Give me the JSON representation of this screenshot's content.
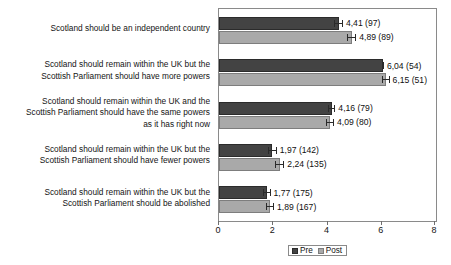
{
  "chart_data": {
    "type": "bar",
    "orientation": "horizontal",
    "title": "",
    "xlabel": "",
    "ylabel": "",
    "xlim": [
      0,
      8
    ],
    "xticks": [
      0,
      2,
      4,
      6,
      8
    ],
    "xtick_labels": [
      "0",
      "2",
      "4",
      "6",
      "8"
    ],
    "grid": false,
    "legend_position": "bottom",
    "decimal_separator": ",",
    "value_label_format": "mean (n)",
    "categories": [
      "Scotland should be an independent country",
      "Scotland should remain within the UK but the Scottish Parliament should have more powers",
      "Scotland should remain within the UK and the Scottish Parliament should have the same powers as it has right now",
      "Scotland should remain within the UK but the Scottish Parliament should have fewer powers",
      "Scotland should remain within the UK but the Scottish Parliament should be abolished"
    ],
    "category_lines": [
      [
        "Scotland should be an independent country"
      ],
      [
        "Scotland should remain within the UK but the",
        "Scottish Parliament should have more powers"
      ],
      [
        "Scotland should remain within the UK and the",
        "Scottish Parliament should have the same powers",
        "as it has right now"
      ],
      [
        "Scotland should remain within the UK but the",
        "Scottish Parliament should have fewer powers"
      ],
      [
        "Scotland should remain within the UK but the",
        "Scottish Parliament should be abolished"
      ]
    ],
    "series": [
      {
        "name": "Pre",
        "color": "#434343",
        "values": [
          4.41,
          6.04,
          4.16,
          1.97,
          1.77
        ],
        "counts": [
          97,
          54,
          79,
          142,
          175
        ],
        "labels": [
          "4,41 (97)",
          "6,04 (54)",
          "4,16 (79)",
          "1,97 (142)",
          "1,77 (175)"
        ]
      },
      {
        "name": "Post",
        "color": "#a9a9a9",
        "values": [
          4.89,
          6.15,
          4.09,
          2.24,
          1.89
        ],
        "counts": [
          89,
          51,
          80,
          135,
          167
        ],
        "labels": [
          "4,89 (89)",
          "6,15 (51)",
          "4,09 (80)",
          "2,24 (135)",
          "1,89 (167)"
        ]
      }
    ]
  },
  "legend": {
    "items": [
      {
        "label": "Pre"
      },
      {
        "label": "Post"
      }
    ]
  }
}
